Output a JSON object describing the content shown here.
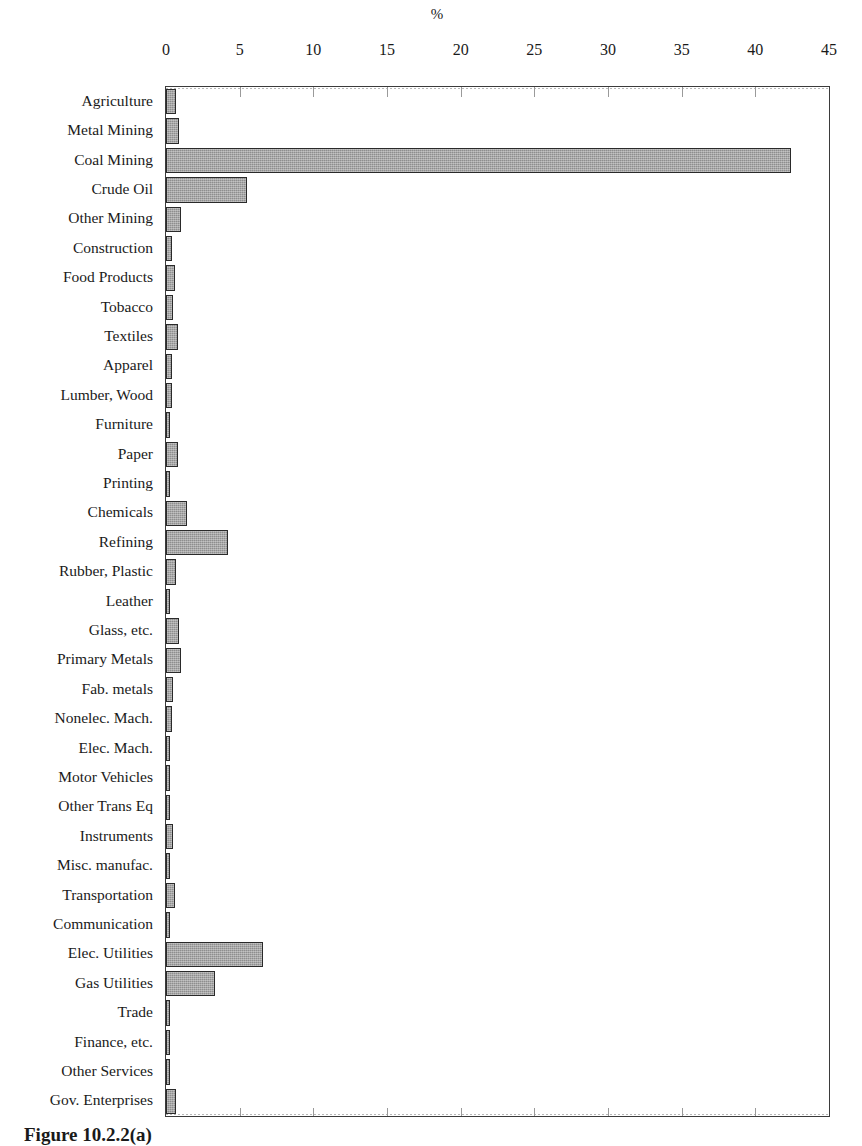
{
  "figure": {
    "axis_title": "%",
    "caption": "Figure 10.2.2(a)"
  },
  "chart_data": {
    "type": "bar",
    "orientation": "horizontal",
    "title": "",
    "xlabel": "%",
    "ylabel": "",
    "xlim": [
      0,
      45
    ],
    "xticks": [
      0,
      5,
      10,
      15,
      20,
      25,
      30,
      35,
      40,
      45
    ],
    "grid": false,
    "legend": "none",
    "bar_color": "#8e8e8e",
    "bar_edge_color": "#2a2a2a",
    "categories": [
      "Agriculture",
      "Metal Mining",
      "Coal Mining",
      "Crude Oil",
      "Other Mining",
      "Construction",
      "Food Products",
      "Tobacco",
      "Textiles",
      "Apparel",
      "Lumber, Wood",
      "Furniture",
      "Paper",
      "Printing",
      "Chemicals",
      "Refining",
      "Rubber, Plastic",
      "Leather",
      "Glass, etc.",
      "Primary Metals",
      "Fab. metals",
      "Nonelec. Mach.",
      "Elec. Mach.",
      "Motor Vehicles",
      "Other Trans Eq",
      "Instruments",
      "Misc. manufac.",
      "Transportation",
      "Communication",
      "Elec. Utilities",
      "Gas Utilities",
      "Trade",
      "Finance, etc.",
      "Other Services",
      "Gov. Enterprises"
    ],
    "values": [
      0.7,
      0.9,
      42.4,
      5.5,
      1.0,
      0.4,
      0.6,
      0.5,
      0.8,
      0.4,
      0.4,
      0.3,
      0.8,
      0.3,
      1.4,
      4.2,
      0.7,
      0.3,
      0.9,
      1.0,
      0.5,
      0.4,
      0.3,
      0.3,
      0.3,
      0.5,
      0.3,
      0.6,
      0.3,
      6.6,
      3.3,
      0.3,
      0.3,
      0.3,
      0.7
    ]
  }
}
